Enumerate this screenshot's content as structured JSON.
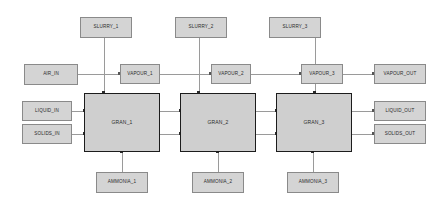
{
  "diagram": {
    "colors": {
      "node_fill": "#d4d4d4",
      "node_border": "#8a8a8a",
      "unit_fill": "#cfcfcf",
      "unit_border": "#1c1c1c",
      "line": "#9a9a9a",
      "background": "#ffffff"
    },
    "units": [
      {
        "id": "gran1",
        "label": "GRAN_1"
      },
      {
        "id": "gran2",
        "label": "GRAN_2"
      },
      {
        "id": "gran3",
        "label": "GRAN_3"
      }
    ],
    "feeds_top": [
      {
        "id": "slurry1",
        "label": "SLURRY_1"
      },
      {
        "id": "slurry2",
        "label": "SLURRY_2"
      },
      {
        "id": "slurry3",
        "label": "SLURRY_3"
      }
    ],
    "feeds_bottom": [
      {
        "id": "ammonia1",
        "label": "AMMONIA_1"
      },
      {
        "id": "ammonia2",
        "label": "AMMONIA_2"
      },
      {
        "id": "ammonia3",
        "label": "AMMONIA_3"
      }
    ],
    "feeds_left": [
      {
        "id": "air_in",
        "label": "AIR_IN"
      },
      {
        "id": "liquid_in",
        "label": "LIQUID_IN"
      },
      {
        "id": "solids_in",
        "label": "SOLIDS_IN"
      }
    ],
    "vapour_stages": [
      {
        "id": "vapour1",
        "label": "VAPOUR_1"
      },
      {
        "id": "vapour2",
        "label": "VAPOUR_2"
      },
      {
        "id": "vapour3",
        "label": "VAPOUR_3"
      }
    ],
    "products_right": [
      {
        "id": "vapour_out",
        "label": "VAPOUR_OUT"
      },
      {
        "id": "liquid_out",
        "label": "LIQUID_OUT"
      },
      {
        "id": "solids_out",
        "label": "SOLIDS_OUT"
      }
    ]
  }
}
